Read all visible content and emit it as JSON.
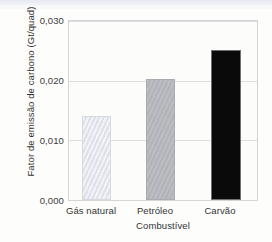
{
  "chart_data": {
    "type": "bar",
    "title": "",
    "subtitle": "",
    "categories": [
      "Gás natural",
      "Petróleo",
      "Carvão"
    ],
    "values": [
      0.0141,
      0.0202,
      0.0252
    ],
    "value_labels": [
      "0,0141",
      "0,0202",
      "0,0252"
    ],
    "xlabel": "Combustível",
    "ylabel": "Fator de emissão de carbono (Gt/quad)",
    "ylim": [
      0.0,
      0.03
    ],
    "ytick_values": [
      0.03,
      0.02,
      0.01,
      0.0
    ],
    "ytick_labels": [
      "0,030",
      "0,020",
      "0,010",
      "0,000"
    ],
    "grid": true,
    "legend": "none",
    "bar_colors": [
      "#e2e4ec",
      "#b4b6bc",
      "#0a0a0a"
    ],
    "plot_background": "#fcfcfa",
    "axis_color": "#d3d5d8",
    "gridline_color": "#dcdee0",
    "text_color": "#333333"
  }
}
